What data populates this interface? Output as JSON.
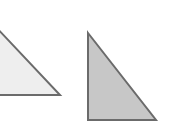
{
  "canvas": {
    "width": 171,
    "height": 129,
    "background_color": "#ffffff",
    "title": "Two right triangles"
  },
  "chart_data": {
    "type": "diagram",
    "xlabel": "",
    "ylabel": "",
    "xlim": [
      0,
      171
    ],
    "ylim": [
      0,
      129
    ],
    "grid": false,
    "legend": "none",
    "shapes": [
      {
        "name": "left-triangle",
        "kind": "right-triangle",
        "orientation": "right-angle-bottom-right",
        "clipped": true,
        "clipped_edge": "left",
        "points": [
          [
            -22,
            8
          ],
          [
            60,
            95
          ],
          [
            -22,
            95
          ]
        ],
        "points_label": "(-22,8) (60,95) (-22,95)",
        "fill_color": "#eeeeee",
        "stroke_color": "#6b6b6b",
        "stroke_width": 2
      },
      {
        "name": "right-triangle",
        "kind": "right-triangle",
        "orientation": "right-angle-bottom-left",
        "clipped": false,
        "points": [
          [
            88,
            33
          ],
          [
            156,
            120
          ],
          [
            88,
            120
          ]
        ],
        "points_label": "(88,33) (156,120) (88,120)",
        "fill_color": "#c7c7c7",
        "stroke_color": "#6b6b6b",
        "stroke_width": 2
      }
    ]
  }
}
